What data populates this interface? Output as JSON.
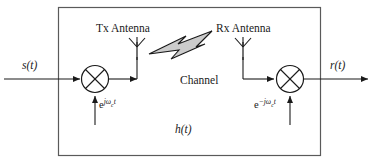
{
  "figure": {
    "background_color": "#ffffff",
    "line_color": "#1a1a1a",
    "bolt_fill_color": "#cccccc"
  },
  "labels": {
    "input_signal": "s(t)",
    "output_signal": "r(t)",
    "tx_antenna": "Tx Antenna",
    "rx_antenna": "Rx Antenna",
    "channel": "Channel",
    "channel_impulse_response": "h(t)",
    "upconversion_carrier": {
      "base": "e",
      "exponent_prefix": "j",
      "exponent_symbol": "ω",
      "exponent_subscript": "c",
      "exponent_suffix": "t"
    },
    "downconversion_carrier": {
      "base": "e",
      "exponent_prefix": "−j",
      "exponent_symbol": "ω",
      "exponent_subscript": "c",
      "exponent_suffix": "t"
    }
  },
  "components": {
    "tx_mixer": "mixer-multiplier-icon",
    "rx_mixer": "mixer-multiplier-icon",
    "tx_antenna_icon": "antenna-icon",
    "rx_antenna_icon": "antenna-icon",
    "propagation_icon": "lightning-bolt-icon",
    "enclosure": "system-boundary-box"
  }
}
